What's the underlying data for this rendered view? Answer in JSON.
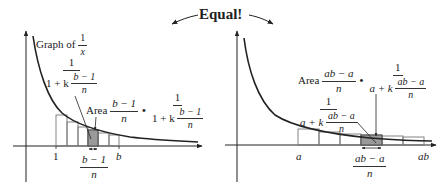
{
  "title": "Equal!",
  "left_panel": {
    "curve_label_prefix": "Graph of",
    "curve_label_num": "1",
    "curve_label_den": "x",
    "height_label": {
      "num": "1",
      "den_prefix": "1 + k",
      "den_frac_num": "b − 1",
      "den_frac_den": "n"
    },
    "area_label": {
      "word": "Area",
      "width_num": "b − 1",
      "width_den": "n",
      "dot": "•",
      "height_num": "1",
      "height_den_prefix": "1 + k",
      "height_den_frac_num": "b − 1",
      "height_den_frac_den": "n"
    },
    "x_ticks": [
      "1",
      "b"
    ],
    "width_label": {
      "num": "b − 1",
      "den": "n"
    }
  },
  "right_panel": {
    "area_label": {
      "word": "Area",
      "width_num": "ab − a",
      "width_den": "n",
      "dot": "•",
      "height_num": "1",
      "height_den_prefix": "a + k",
      "height_den_frac_num": "ab − a",
      "height_den_frac_den": "n"
    },
    "height_label": {
      "num": "1",
      "den_prefix": "a + k",
      "den_frac_num": "ab − a",
      "den_frac_den": "n"
    },
    "x_ticks": [
      "a",
      "ab"
    ],
    "width_label": {
      "num": "ab − a",
      "den": "n"
    }
  },
  "colors": {
    "ink": "#222222",
    "shade": "#9a9a9a",
    "box": "#777777"
  }
}
